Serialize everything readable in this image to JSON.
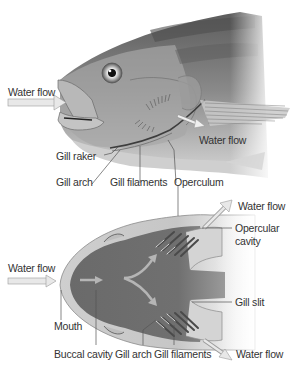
{
  "figure": {
    "side_view": {
      "labels": {
        "water_flow_in": "Water flow",
        "water_flow_out": "Water flow",
        "gill_raker": "Gill raker",
        "gill_arch": "Gill arch",
        "gill_filaments": "Gill filaments",
        "operculum": "Operculum"
      }
    },
    "top_view": {
      "labels": {
        "water_flow_in": "Water flow",
        "water_flow_out_top": "Water flow",
        "opercular_cavity_line1": "Opercular",
        "opercular_cavity_line2": "cavity",
        "gill_slit": "Gill slit",
        "mouth": "Mouth",
        "buccal_cavity": "Buccal cavity",
        "gill_arch": "Gill arch",
        "gill_filaments": "Gill filaments",
        "water_flow_out_bottom": "Water flow"
      }
    },
    "colors": {
      "body_dark": "#5a5a5a",
      "body_mid": "#8c8c8c",
      "body_light": "#d9d9d9",
      "cavity": "#6e6e6e",
      "arrow_fill": "#e6e6e6",
      "arrow_stroke": "#9a9a9a",
      "leader_line": "#555555",
      "text": "#333333"
    }
  }
}
